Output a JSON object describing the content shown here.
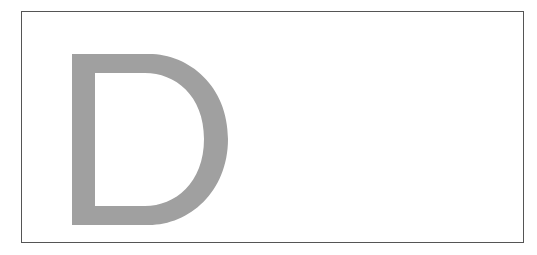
{
  "canvas": {
    "width": 537,
    "height": 255,
    "background_color": "#ffffff"
  },
  "frame": {
    "name": "bordered-rectangle",
    "border_color": "#555555",
    "border_width_px": 1,
    "fill_color": "#ffffff",
    "x": 21,
    "y": 11,
    "width": 503,
    "height": 232
  },
  "glyph": {
    "character": "D",
    "label": "Letter D",
    "color": "#a0a0a0",
    "x": 49,
    "y": 41,
    "width": 158,
    "height": 173,
    "stem_width_px": 23,
    "style": "uppercase sans-serif",
    "alignment": "left-aligned inside frame"
  }
}
